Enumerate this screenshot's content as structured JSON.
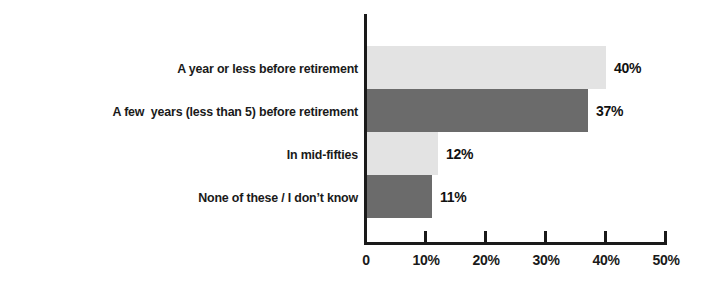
{
  "chart_data": {
    "type": "bar",
    "orientation": "horizontal",
    "title": "",
    "subtitle": "",
    "xlabel": "",
    "ylabel": "",
    "xlim": [
      0,
      50
    ],
    "grid": false,
    "legend": "none",
    "categories": [
      "A year or less before retirement",
      "A few  years (less than 5) before retirement",
      "In mid-fifties",
      "None of these / I don’t know"
    ],
    "values": [
      40,
      37,
      12,
      11
    ],
    "data_labels": [
      "40%",
      "37%",
      "12%",
      "11%"
    ],
    "bar_colors": [
      "#e3e3e3",
      "#6b6b6b",
      "#e3e3e3",
      "#6b6b6b"
    ],
    "xticks": [
      0,
      10,
      20,
      30,
      40,
      50
    ],
    "xtick_labels": [
      "0",
      "10%",
      "20%",
      "30%",
      "40%",
      "50%"
    ],
    "axis_color": "#1a1a1a",
    "text_color": "#1a1a1a"
  }
}
